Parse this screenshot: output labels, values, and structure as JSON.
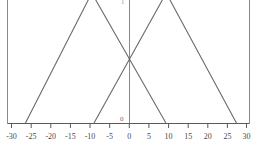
{
  "chart_data": {
    "type": "line",
    "title": "",
    "xlabel": "",
    "ylabel": "",
    "xlim": [
      -30,
      30
    ],
    "ylim": [
      0,
      1.18
    ],
    "grid": false,
    "legend": "none",
    "xticks": [
      -30,
      -25,
      -20,
      -15,
      -10,
      -5,
      0,
      5,
      10,
      15,
      20,
      25,
      30
    ],
    "xtick_labels": [
      "-30",
      "-25",
      "-20",
      "-15",
      "-10",
      "-5",
      "0",
      "5",
      "10",
      "15",
      "20",
      "25",
      "30"
    ],
    "yticks": [
      0
    ],
    "ytick_labels": [
      "0"
    ],
    "annotations": [
      "triangle apexes clipped at top frame"
    ],
    "series": [
      {
        "name": "left-triangle",
        "color": "#6a6a6a",
        "x": [
          -26.5,
          -9.5,
          9.5
        ],
        "y": [
          0,
          1.18,
          0
        ]
      },
      {
        "name": "right-triangle",
        "color": "#6a6a6a",
        "x": [
          -9.0,
          9.5,
          27.5
        ],
        "y": [
          0,
          1.18,
          0
        ]
      }
    ]
  },
  "axes": {
    "x_axis_name": "x-axis",
    "y_axis_name": "y-axis",
    "frame_left_label": "left-frame-border",
    "frame_right_label": "right-frame-border",
    "axis_color": "#6a6a6a",
    "baseline_color": "#5a5a5a"
  },
  "canvas": {
    "background": "#ffffff",
    "width": 256,
    "height": 147
  },
  "top_stub": {
    "text": "1"
  }
}
